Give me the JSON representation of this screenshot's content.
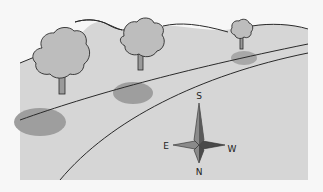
{
  "diagram": {
    "colors": {
      "background": "#f7f7f7",
      "ground": "#d6d6d6",
      "tree_fill": "#bdbdbd",
      "shadow": "#9e9e9e",
      "line": "#2a2a2a",
      "compass_light": "#8a8a8a",
      "compass_dark": "#4a4a4a"
    },
    "trees": [
      {
        "name": "large-left-tree",
        "x": 62,
        "y": 52
      },
      {
        "name": "middle-tree",
        "x": 140,
        "y": 40
      },
      {
        "name": "small-right-tree",
        "x": 240,
        "y": 32
      }
    ],
    "compass": {
      "top_label": "S",
      "bottom_label": "N",
      "left_label": "E",
      "right_label": "W"
    }
  }
}
